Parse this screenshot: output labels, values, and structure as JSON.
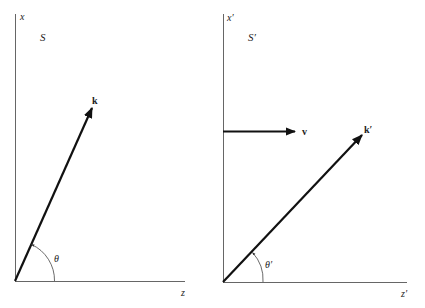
{
  "diagram": {
    "left_frame": {
      "frame_label": "S",
      "vertical_axis_label": "x",
      "horizontal_axis_label": "z",
      "vector_label": "k",
      "angle_label": "θ"
    },
    "right_frame": {
      "frame_label": "S′",
      "vertical_axis_label": "x′",
      "horizontal_axis_label": "z′",
      "velocity_label": "v",
      "vector_label": "k′",
      "angle_label": "θ′"
    },
    "colors": {
      "axis": "#555555",
      "vector": "#111111",
      "text": "#222222"
    }
  }
}
